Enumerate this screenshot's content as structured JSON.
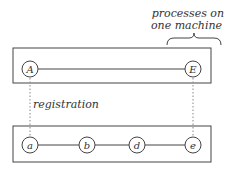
{
  "annotation": {
    "line1": "processes on",
    "line2": "one machine"
  },
  "registration_label": "registration",
  "top_group": {
    "nodes": [
      {
        "label": "A",
        "x": 30
      },
      {
        "label": "E",
        "x": 193
      }
    ]
  },
  "bottom_group": {
    "nodes": [
      {
        "label": "a",
        "x": 30
      },
      {
        "label": "b",
        "x": 87
      },
      {
        "label": "d",
        "x": 137
      },
      {
        "label": "e",
        "x": 193
      }
    ]
  },
  "colors": {
    "stroke": "#444444",
    "text": "#333333",
    "dotted": "#888888"
  }
}
